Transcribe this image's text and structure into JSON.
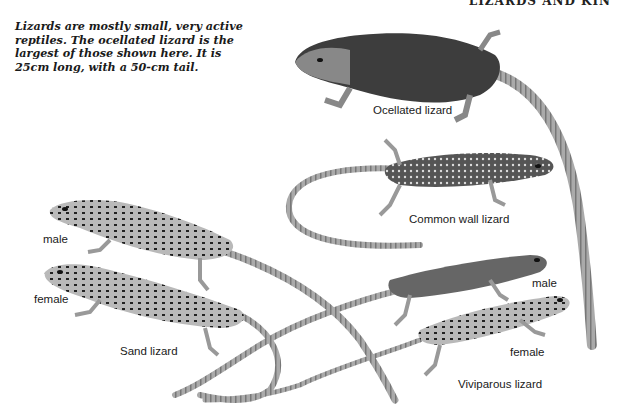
{
  "page": {
    "running_head": "LIZARDS AND KIN",
    "intro_text": "Lizards are mostly small, very active reptiles. The ocellated lizard is the largest of those shown here. It is 25cm long, with a 50-cm tail."
  },
  "illustrations": {
    "ocellated": {
      "label": "Ocellated lizard"
    },
    "common_wall": {
      "label": "Common wall lizard"
    },
    "sand": {
      "label": "Sand lizard",
      "male_label": "male",
      "female_label": "female"
    },
    "viviparous": {
      "label": "Viviparous lizard",
      "male_label": "male",
      "female_label": "female"
    }
  },
  "colors": {
    "ink": "#1a1a1a",
    "body_dark": "#3a3a3a",
    "body_mid": "#8a8a8a",
    "body_light": "#c8c8c8"
  }
}
